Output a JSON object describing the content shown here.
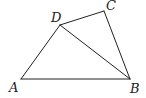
{
  "diagram": {
    "type": "geometry-quadrilateral",
    "points": {
      "A": {
        "x": 21,
        "y": 79,
        "label": "A",
        "lx": 9,
        "ly": 92
      },
      "B": {
        "x": 130,
        "y": 79,
        "label": "B",
        "lx": 130,
        "ly": 93
      },
      "C": {
        "x": 104,
        "y": 11,
        "label": "C",
        "lx": 106,
        "ly": 10
      },
      "D": {
        "x": 60,
        "y": 25,
        "label": "D",
        "lx": 51,
        "ly": 22
      }
    },
    "segments": [
      {
        "from": "A",
        "to": "B"
      },
      {
        "from": "A",
        "to": "D"
      },
      {
        "from": "D",
        "to": "C"
      },
      {
        "from": "C",
        "to": "B"
      },
      {
        "from": "D",
        "to": "B"
      }
    ],
    "stroke_color": "#222222"
  }
}
